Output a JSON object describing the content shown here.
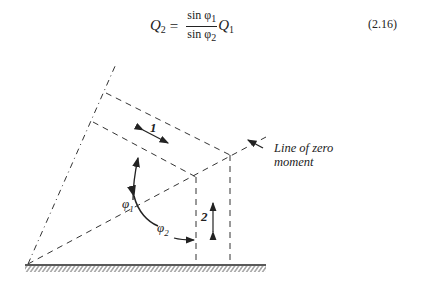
{
  "equation": {
    "lhs_symbol": "Q",
    "lhs_sub": "2",
    "equals": "=",
    "numerator": "sin φ",
    "numerator_sub": "1",
    "denominator": "sin φ",
    "denominator_sub": "2",
    "rhs_symbol": "Q",
    "rhs_sub": "1",
    "number": "(2.16)"
  },
  "diagram": {
    "labels": {
      "phi1": "φ",
      "phi1_sub": "1",
      "phi2": "φ",
      "phi2_sub": "2",
      "direction1": "1",
      "direction2": "2",
      "zero_moment_line_1": "Line of zero",
      "zero_moment_line_2": "moment"
    },
    "colors": {
      "line": "#333333",
      "background": "#ffffff"
    }
  }
}
